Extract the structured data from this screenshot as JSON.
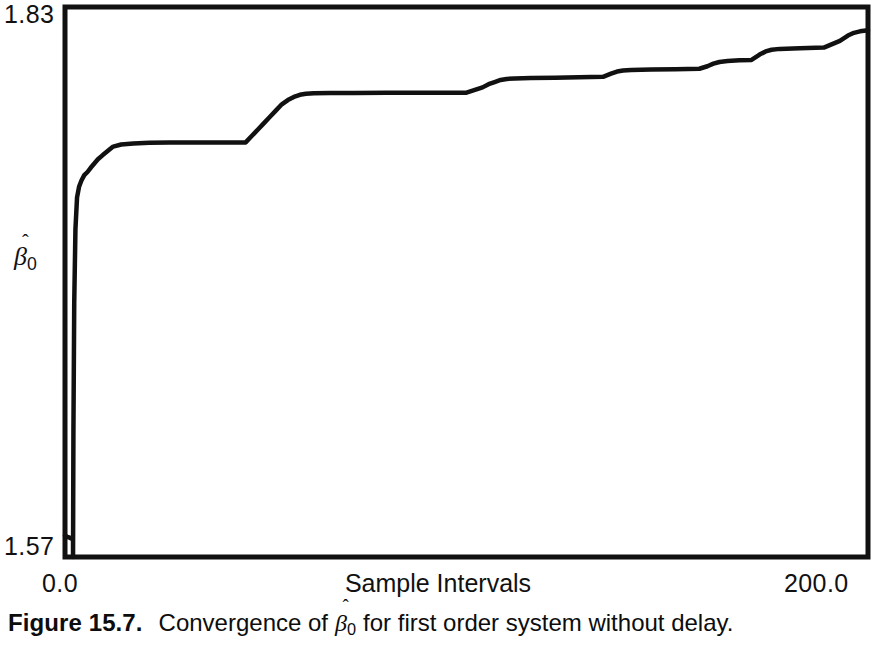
{
  "figure": {
    "caption_label": "Figure 15.7.",
    "caption_text_before": "Convergence of",
    "caption_text_after": "for first order system without delay.",
    "caption_symbol_base": "β",
    "caption_symbol_hat": "ˆ",
    "caption_symbol_sub": "0",
    "line_color": "#111111",
    "frame_color": "#111111",
    "background_color": "#ffffff"
  },
  "axes": {
    "y_title_base": "β",
    "y_title_hat": "ˆ",
    "y_title_sub": "0",
    "y_max_label": "1.83",
    "y_min_label": "1.57",
    "x_min_label": "0.0",
    "x_max_label": "200.0",
    "x_title": "Sample Intervals"
  },
  "chart_data": {
    "type": "line",
    "xlabel": "Sample Intervals",
    "ylabel": "beta-hat-0",
    "xlim": [
      0.0,
      200.0
    ],
    "ylim": [
      1.57,
      1.83
    ],
    "grid": false,
    "legend": "none",
    "series": [
      {
        "name": "beta-hat-0 estimate",
        "x": [
          0.0,
          0.6,
          1.3,
          1.8,
          2.0,
          2.0,
          2.1,
          2.3,
          2.6,
          3.0,
          3.5,
          4.1,
          4.8,
          5.6,
          6.4,
          7.3,
          8.2,
          9.4,
          10.7,
          12.0,
          14.0,
          17.0,
          21.0,
          26.0,
          32.0,
          39.0,
          45.0,
          46.5,
          48.0,
          49.5,
          51.0,
          52.5,
          54.0,
          55.5,
          57.0,
          58.5,
          60.0,
          62.0,
          66.0,
          72.0,
          80.0,
          88.0,
          94.0,
          100.0,
          104.0,
          105.5,
          107.0,
          108.5,
          110.0,
          112.0,
          116.0,
          122.0,
          128.0,
          134.0,
          136.0,
          137.5,
          139.0,
          141.0,
          146.0,
          152.0,
          158.0,
          160.0,
          161.5,
          163.0,
          165.0,
          168.0,
          171.0,
          173.0,
          174.5,
          176.0,
          178.0,
          183.0,
          189.0,
          193.0,
          195.0,
          196.5,
          198.0,
          200.0
        ],
        "y": [
          1.58,
          1.5795,
          1.579,
          1.5785,
          1.578,
          1.57,
          1.63,
          1.69,
          1.725,
          1.74,
          1.745,
          1.748,
          1.7505,
          1.752,
          1.754,
          1.756,
          1.758,
          1.76,
          1.762,
          1.764,
          1.765,
          1.7655,
          1.7658,
          1.766,
          1.766,
          1.766,
          1.766,
          1.769,
          1.772,
          1.775,
          1.778,
          1.781,
          1.784,
          1.786,
          1.7875,
          1.7885,
          1.789,
          1.7892,
          1.7893,
          1.7894,
          1.7895,
          1.7895,
          1.7895,
          1.7895,
          1.792,
          1.7935,
          1.7945,
          1.7955,
          1.796,
          1.7962,
          1.7964,
          1.7966,
          1.7968,
          1.797,
          1.7985,
          1.7995,
          1.8,
          1.8002,
          1.8004,
          1.8006,
          1.8008,
          1.802,
          1.8032,
          1.804,
          1.8045,
          1.8048,
          1.805,
          1.8075,
          1.809,
          1.8098,
          1.8102,
          1.8105,
          1.8108,
          1.814,
          1.8165,
          1.8178,
          1.8185,
          1.819
        ]
      }
    ]
  },
  "plot_geometry": {
    "frame_left": 65,
    "frame_top": 7,
    "frame_right": 868,
    "frame_bottom": 557,
    "frame_stroke_width": 5,
    "line_stroke_width": 4.5
  }
}
